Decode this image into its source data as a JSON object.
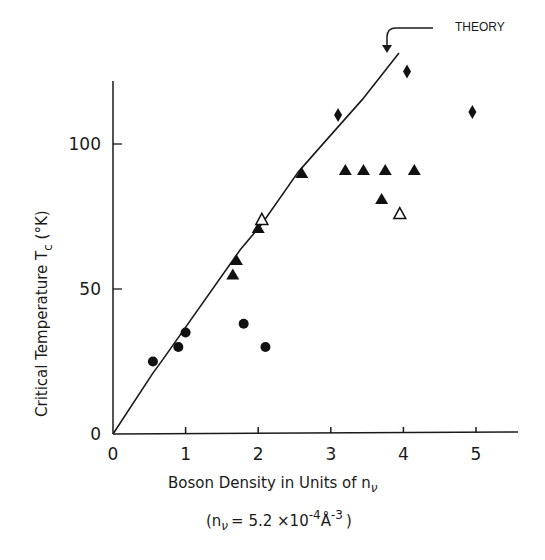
{
  "chart_data": {
    "type": "scatter",
    "title": "",
    "xlabel": "Boson Density in Units of n_ν",
    "xlabel_parts": {
      "main": "Boson Density in Units of n",
      "sub": "ν"
    },
    "xlabel_note": "(n_ν = 5.2 ×10^-4 Å^-3)",
    "xlabel_note_parts": {
      "open": "(n",
      "sub": "ν",
      "eq": "= 5.2  ×10",
      "exp1": "-4",
      "unit": "Å",
      "exp2": "-3",
      "close": ")"
    },
    "ylabel": "Critical Temperature T_c (°K)",
    "ylabel_parts": {
      "main": "Critical Temperature  T",
      "sub": "c",
      "unit": " (°K)"
    },
    "xlim": [
      0,
      5.5
    ],
    "ylim": [
      0,
      125
    ],
    "x_ticks": [
      "0",
      "1",
      "2",
      "3",
      "4",
      "5"
    ],
    "y_ticks": [
      "0",
      "50",
      "100"
    ],
    "grid": false,
    "legend": null,
    "annotations": [
      {
        "text": "THEORY",
        "points_to": "theory curve end"
      }
    ],
    "series": [
      {
        "name": "filled circles",
        "marker": "circle-filled",
        "points": [
          [
            0.55,
            25
          ],
          [
            0.9,
            30
          ],
          [
            1.0,
            35
          ],
          [
            1.8,
            38
          ],
          [
            2.1,
            30
          ]
        ]
      },
      {
        "name": "filled triangles",
        "marker": "triangle-filled",
        "points": [
          [
            1.65,
            55
          ],
          [
            1.7,
            60
          ],
          [
            2.0,
            71
          ],
          [
            2.6,
            90
          ],
          [
            3.2,
            91
          ],
          [
            3.45,
            91
          ],
          [
            3.75,
            91
          ],
          [
            4.15,
            91
          ],
          [
            3.7,
            81
          ]
        ]
      },
      {
        "name": "open triangles",
        "marker": "triangle-open",
        "points": [
          [
            2.05,
            74
          ],
          [
            3.95,
            76
          ]
        ]
      },
      {
        "name": "filled diamonds",
        "marker": "diamond-filled",
        "points": [
          [
            3.1,
            110
          ],
          [
            4.05,
            125
          ],
          [
            4.95,
            111
          ]
        ]
      },
      {
        "name": "THEORY",
        "marker": "line",
        "points": [
          [
            0,
            0
          ],
          [
            0.55,
            21
          ],
          [
            0.68,
            25.5
          ],
          [
            1.75,
            63.4
          ],
          [
            2.05,
            72.4
          ],
          [
            2.55,
            90.3
          ],
          [
            2.88,
            99.7
          ],
          [
            3.43,
            115.2
          ],
          [
            3.94,
            131.4
          ]
        ]
      }
    ]
  }
}
